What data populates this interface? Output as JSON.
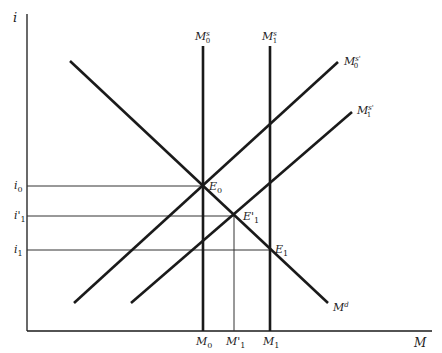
{
  "diagram": {
    "type": "money_market_supply_demand",
    "axes": {
      "y_label": "i",
      "x_label": "M"
    },
    "curves": [
      {
        "id": "Md",
        "label": "M",
        "sup": "d",
        "kind": "demand",
        "from": [
          70,
          61
        ],
        "to": [
          328,
          303
        ]
      },
      {
        "id": "M0s",
        "label": "M",
        "sub": "0",
        "sup": "s",
        "kind": "vertical-supply",
        "x": 203,
        "top": 46
      },
      {
        "id": "M1s",
        "label": "M",
        "sub": "1",
        "sup": "s",
        "kind": "vertical-supply",
        "x": 270,
        "top": 46
      },
      {
        "id": "M0s_prime",
        "label": "M",
        "sub": "0",
        "sup": "s'",
        "kind": "upward-supply",
        "from": [
          74,
          303
        ],
        "to": [
          338,
          62
        ]
      },
      {
        "id": "M1s_prime",
        "label": "M",
        "sub": "1",
        "sup": "s'",
        "kind": "upward-supply",
        "from": [
          131,
          303
        ],
        "to": [
          352,
          112
        ]
      }
    ],
    "equilibria": [
      {
        "id": "E0",
        "label": "E",
        "sub": "0",
        "x": 203,
        "y": 186
      },
      {
        "id": "E1_prime",
        "label": "E",
        "sub": "1",
        "prime": true,
        "x": 234,
        "y": 216
      },
      {
        "id": "E1",
        "label": "E",
        "sub": "1",
        "x": 270,
        "y": 250
      }
    ],
    "y_ticks": [
      {
        "label": "i",
        "sub": "0",
        "prime": false,
        "y": 186
      },
      {
        "label": "i",
        "sub": "1",
        "prime": true,
        "y": 216
      },
      {
        "label": "i",
        "sub": "1",
        "prime": false,
        "y": 250
      }
    ],
    "x_ticks": [
      {
        "label": "M",
        "sub": "0",
        "prime": false,
        "x": 203
      },
      {
        "label": "M",
        "sub": "1",
        "prime": true,
        "x": 234
      },
      {
        "label": "M",
        "sub": "1",
        "prime": false,
        "x": 270
      }
    ],
    "text": {
      "i_axis": "i",
      "m_axis": "M",
      "md": "M",
      "md_sup": "d",
      "m0s": "M",
      "m0s_sub": "0",
      "m0s_sup": "s",
      "m1s": "M",
      "m1s_sub": "1",
      "m1s_sup": "s",
      "m0sp": "M",
      "m0sp_sub": "0",
      "m0sp_sup": "s'",
      "m1sp": "M",
      "m1sp_sub": "1",
      "m1sp_sup": "s'",
      "e0": "E",
      "e0_sub": "0",
      "e1p": "E'",
      "e1p_sub": "1",
      "e1": "E",
      "e1_sub": "1",
      "i0": "i",
      "i0_sub": "0",
      "i1p": "i'",
      "i1p_sub": "1",
      "i1": "i",
      "i1_sub": "1",
      "xm0": "M",
      "xm0_sub": "0",
      "xm1p": "M'",
      "xm1p_sub": "1",
      "xm1": "M",
      "xm1_sub": "1"
    },
    "colors": {
      "line": "#1a1a1a",
      "guide": "#333333",
      "background": "#ffffff"
    }
  }
}
